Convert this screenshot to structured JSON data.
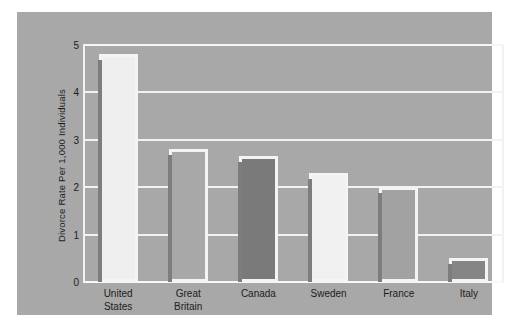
{
  "chart_data": {
    "type": "bar",
    "title": "",
    "subtitle": "",
    "xlabel": "",
    "ylabel": "Divorce Rate Per 1,000 Individuals",
    "categories": [
      "United States",
      "Great Britain",
      "Canada",
      "Sweden",
      "France",
      "Italy"
    ],
    "category_lines": [
      [
        "United",
        "States"
      ],
      [
        "Great",
        "Britain"
      ],
      [
        "Canada"
      ],
      [
        "Sweden"
      ],
      [
        "France"
      ],
      [
        "Italy"
      ]
    ],
    "values": [
      4.8,
      2.8,
      2.65,
      2.3,
      2.0,
      0.5
    ],
    "ylim": [
      0,
      5
    ],
    "yticks": [
      0,
      1,
      2,
      3,
      4,
      5
    ],
    "ytick_labels": [
      "0",
      "1",
      "2",
      "3",
      "4",
      "5"
    ],
    "grid": true,
    "legend": "none",
    "bar_fills": [
      "#efefef",
      "#a8a8a8",
      "#7a7a7a",
      "#f0f0f0",
      "#a2a2a2",
      "#858585"
    ],
    "bar_border": "#f4f4f4",
    "plot_background": "#a8a8a8",
    "gridline_color": "#f2f2f2",
    "page_background": "#ffffff",
    "text_color": "#1c1c1c"
  }
}
